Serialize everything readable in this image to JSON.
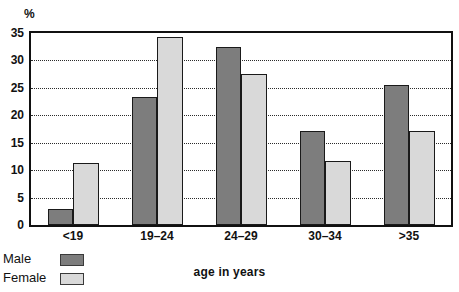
{
  "chart_data": {
    "type": "bar",
    "title": "",
    "subtitle": "",
    "xlabel": "age in years",
    "ylabel": "%",
    "unit_label": "%",
    "categories": [
      "<19",
      "19–24",
      "24–29",
      "30–34",
      ">35"
    ],
    "series": [
      {
        "name": "Male",
        "color": "#7d7d7d",
        "values": [
          3.0,
          23.3,
          32.4,
          17.2,
          25.5
        ]
      },
      {
        "name": "Female",
        "color": "#d9d9d9",
        "values": [
          11.3,
          34.2,
          27.6,
          11.7,
          17.2
        ]
      }
    ],
    "ylim": [
      0,
      35
    ],
    "yticks": [
      0,
      5,
      10,
      15,
      20,
      25,
      30,
      35
    ],
    "ytick_labels": [
      "0",
      "5",
      "10",
      "15",
      "20",
      "25",
      "30",
      "35"
    ],
    "grid": true,
    "grid_style": "dotted",
    "legend_position": "bottom-left",
    "legend_entries": [
      "Male",
      "Female"
    ],
    "plot_border": true,
    "background_color": "#ffffff",
    "axis_color": "#111111"
  }
}
